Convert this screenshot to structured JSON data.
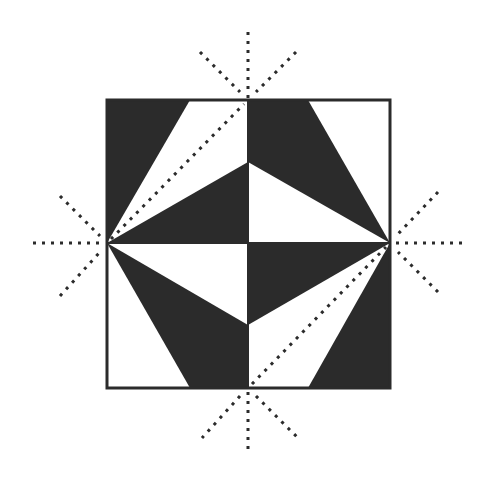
{
  "diagram": {
    "colors": {
      "dark": "#2b2b2b",
      "light": "#ffffff",
      "border": "#2b2b2b",
      "dots": "#2b2b2b"
    },
    "square": {
      "x": 107,
      "y": 100,
      "width": 283,
      "height": 288
    },
    "dark_shapes": [
      {
        "name": "top-left-dark",
        "points": "107,100 190,100 107,243"
      },
      {
        "name": "top-left-dark-lower",
        "points": "107,243 248,162 248,243"
      },
      {
        "name": "top-right-dark",
        "points": "248,100 308,100 390,243 248,162"
      },
      {
        "name": "bottom-left-dark",
        "points": "107,243 248,325 248,388 190,388"
      },
      {
        "name": "bottom-right-dark-upper",
        "points": "248,243 390,243 248,325"
      },
      {
        "name": "bottom-right-dark",
        "points": "390,243 390,388 308,388"
      }
    ],
    "fold_lines": [
      {
        "name": "top-vertical",
        "x1": 248,
        "y1": 32,
        "x2": 248,
        "y2": 98
      },
      {
        "name": "top-left-diagonal",
        "x1": 200,
        "y1": 52,
        "x2": 240,
        "y2": 92
      },
      {
        "name": "top-right-diagonal",
        "x1": 296,
        "y1": 52,
        "x2": 256,
        "y2": 92
      },
      {
        "name": "left-horizontal",
        "x1": 33,
        "y1": 243,
        "x2": 103,
        "y2": 243
      },
      {
        "name": "left-upper-diagonal",
        "x1": 60,
        "y1": 196,
        "x2": 100,
        "y2": 236
      },
      {
        "name": "left-lower-diagonal",
        "x1": 60,
        "y1": 296,
        "x2": 100,
        "y2": 252
      },
      {
        "name": "right-horizontal",
        "x1": 396,
        "y1": 243,
        "x2": 466,
        "y2": 243
      },
      {
        "name": "right-upper-diagonal",
        "x1": 438,
        "y1": 192,
        "x2": 398,
        "y2": 234
      },
      {
        "name": "right-lower-diagonal",
        "x1": 438,
        "y1": 292,
        "x2": 398,
        "y2": 252
      },
      {
        "name": "bottom-vertical",
        "x1": 248,
        "y1": 392,
        "x2": 248,
        "y2": 455
      },
      {
        "name": "bottom-left-diagonal",
        "x1": 240,
        "y1": 396,
        "x2": 202,
        "y2": 438
      },
      {
        "name": "bottom-right-diagonal",
        "x1": 256,
        "y1": 396,
        "x2": 298,
        "y2": 438
      },
      {
        "name": "inner-diagonal-top-left",
        "x1": 111,
        "y1": 239,
        "x2": 244,
        "y2": 104
      },
      {
        "name": "inner-diagonal-bottom-right",
        "x1": 252,
        "y1": 384,
        "x2": 386,
        "y2": 247
      }
    ]
  }
}
